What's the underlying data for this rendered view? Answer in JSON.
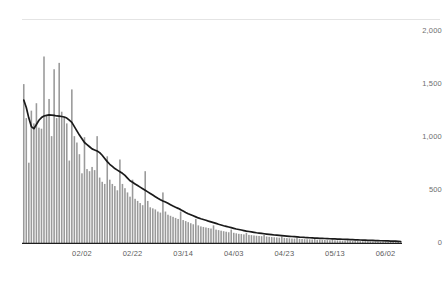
{
  "chart_data": {
    "type": "bar",
    "title": "",
    "subtitle": "",
    "xlabel": "",
    "ylabel": "",
    "ylim": [
      0,
      2000
    ],
    "grid": false,
    "legend": null,
    "y_ticks": [
      0,
      500,
      1000,
      1500,
      2000
    ],
    "y_tick_labels": [
      "0",
      "500",
      "1,000",
      "1,500",
      "2,000"
    ],
    "x_tick_labels": [
      "02/02",
      "02/22",
      "03/14",
      "04/03",
      "04/23",
      "05/13",
      "06/02"
    ],
    "x_tick_indices": [
      23,
      43,
      63,
      83,
      103,
      123,
      143
    ],
    "bar_color": "#9a9a9a",
    "line_color": "#1a1a1a",
    "axis_line_color": "#e2e2e2",
    "background_color": "#ffffff",
    "categories": [
      "01/10",
      "01/11",
      "01/12",
      "01/13",
      "01/14",
      "01/15",
      "01/16",
      "01/17",
      "01/18",
      "01/19",
      "01/20",
      "01/21",
      "01/22",
      "01/23",
      "01/24",
      "01/25",
      "01/26",
      "01/27",
      "01/28",
      "01/29",
      "01/30",
      "01/31",
      "02/01",
      "02/02",
      "02/03",
      "02/04",
      "02/05",
      "02/06",
      "02/07",
      "02/08",
      "02/09",
      "02/10",
      "02/11",
      "02/12",
      "02/13",
      "02/14",
      "02/15",
      "02/16",
      "02/17",
      "02/18",
      "02/19",
      "02/20",
      "02/21",
      "02/22",
      "02/23",
      "02/24",
      "02/25",
      "02/26",
      "02/27",
      "02/28",
      "03/01",
      "03/02",
      "03/03",
      "03/04",
      "03/05",
      "03/06",
      "03/07",
      "03/08",
      "03/09",
      "03/10",
      "03/11",
      "03/12",
      "03/13",
      "03/14",
      "03/15",
      "03/16",
      "03/17",
      "03/18",
      "03/19",
      "03/20",
      "03/21",
      "03/22",
      "03/23",
      "03/24",
      "03/25",
      "03/26",
      "03/27",
      "03/28",
      "03/29",
      "03/30",
      "03/31",
      "04/01",
      "04/02",
      "04/03",
      "04/04",
      "04/05",
      "04/06",
      "04/07",
      "04/08",
      "04/09",
      "04/10",
      "04/11",
      "04/12",
      "04/13",
      "04/14",
      "04/15",
      "04/16",
      "04/17",
      "04/18",
      "04/19",
      "04/20",
      "04/21",
      "04/22",
      "04/23",
      "04/24",
      "04/25",
      "04/26",
      "04/27",
      "04/28",
      "04/29",
      "04/30",
      "05/01",
      "05/02",
      "05/03",
      "05/04",
      "05/05",
      "05/06",
      "05/07",
      "05/08",
      "05/09",
      "05/10",
      "05/11",
      "05/12",
      "05/13",
      "05/14",
      "05/15",
      "05/16",
      "05/17",
      "05/18",
      "05/19",
      "05/20",
      "05/21",
      "05/22",
      "05/23",
      "05/24",
      "05/25",
      "05/26",
      "05/27",
      "05/28",
      "05/29",
      "05/30",
      "05/31",
      "06/01",
      "06/02",
      "06/03",
      "06/04",
      "06/05",
      "06/06",
      "06/07",
      "06/08"
    ],
    "series": [
      {
        "name": "Daily count",
        "type": "bar",
        "values": [
          1500,
          1180,
          760,
          1250,
          1130,
          1320,
          1090,
          1080,
          1760,
          1200,
          1360,
          1010,
          1640,
          1180,
          1700,
          1240,
          1190,
          1130,
          780,
          1450,
          1010,
          950,
          840,
          660,
          1000,
          700,
          680,
          720,
          690,
          1010,
          620,
          580,
          560,
          820,
          600,
          560,
          540,
          500,
          790,
          560,
          520,
          480,
          440,
          600,
          420,
          400,
          380,
          360,
          680,
          400,
          340,
          330,
          320,
          300,
          290,
          480,
          300,
          270,
          260,
          250,
          240,
          230,
          300,
          220,
          210,
          200,
          190,
          180,
          230,
          170,
          160,
          155,
          150,
          145,
          140,
          170,
          130,
          125,
          120,
          115,
          110,
          105,
          130,
          100,
          95,
          90,
          88,
          85,
          100,
          80,
          78,
          75,
          72,
          70,
          68,
          80,
          65,
          62,
          60,
          58,
          56,
          54,
          66,
          52,
          50,
          48,
          46,
          45,
          55,
          43,
          42,
          40,
          39,
          38,
          37,
          45,
          35,
          34,
          33,
          32,
          31,
          30,
          36,
          29,
          28,
          27,
          26,
          25,
          30,
          24,
          23,
          22,
          22,
          21,
          20,
          25,
          19,
          18,
          18,
          17,
          17,
          16,
          20,
          15,
          15,
          14,
          14,
          13,
          16,
          12
        ]
      },
      {
        "name": "7-day moving average",
        "type": "line",
        "values": [
          1350,
          1280,
          1180,
          1100,
          1080,
          1120,
          1160,
          1185,
          1200,
          1205,
          1210,
          1208,
          1205,
          1200,
          1198,
          1195,
          1190,
          1180,
          1160,
          1140,
          1100,
          1060,
          1020,
          985,
          950,
          930,
          910,
          890,
          880,
          870,
          855,
          830,
          800,
          770,
          745,
          725,
          705,
          690,
          675,
          660,
          640,
          615,
          590,
          575,
          560,
          545,
          530,
          515,
          500,
          485,
          470,
          455,
          440,
          425,
          412,
          400,
          390,
          378,
          365,
          352,
          340,
          330,
          318,
          305,
          292,
          280,
          270,
          260,
          250,
          240,
          232,
          225,
          218,
          210,
          203,
          196,
          188,
          180,
          173,
          166,
          160,
          154,
          148,
          142,
          136,
          131,
          126,
          121,
          116,
          112,
          108,
          104,
          100,
          97,
          94,
          91,
          88,
          85,
          82,
          79,
          77,
          75,
          73,
          71,
          69,
          67,
          65,
          63,
          61,
          59,
          58,
          56,
          55,
          53,
          52,
          50,
          49,
          48,
          47,
          46,
          45,
          44,
          43,
          42,
          41,
          40,
          39,
          38,
          37,
          36,
          35,
          34,
          33,
          32,
          31,
          30,
          29,
          28,
          28,
          27,
          26,
          25,
          25,
          24,
          23,
          22,
          22,
          21,
          20,
          18
        ]
      }
    ]
  },
  "axis": {
    "y_labels": [
      "2,000",
      "1,500",
      "1,000",
      "500",
      "0"
    ],
    "x_labels": [
      "02/02",
      "02/22",
      "03/14",
      "04/03",
      "04/23",
      "05/13",
      "06/02"
    ]
  }
}
